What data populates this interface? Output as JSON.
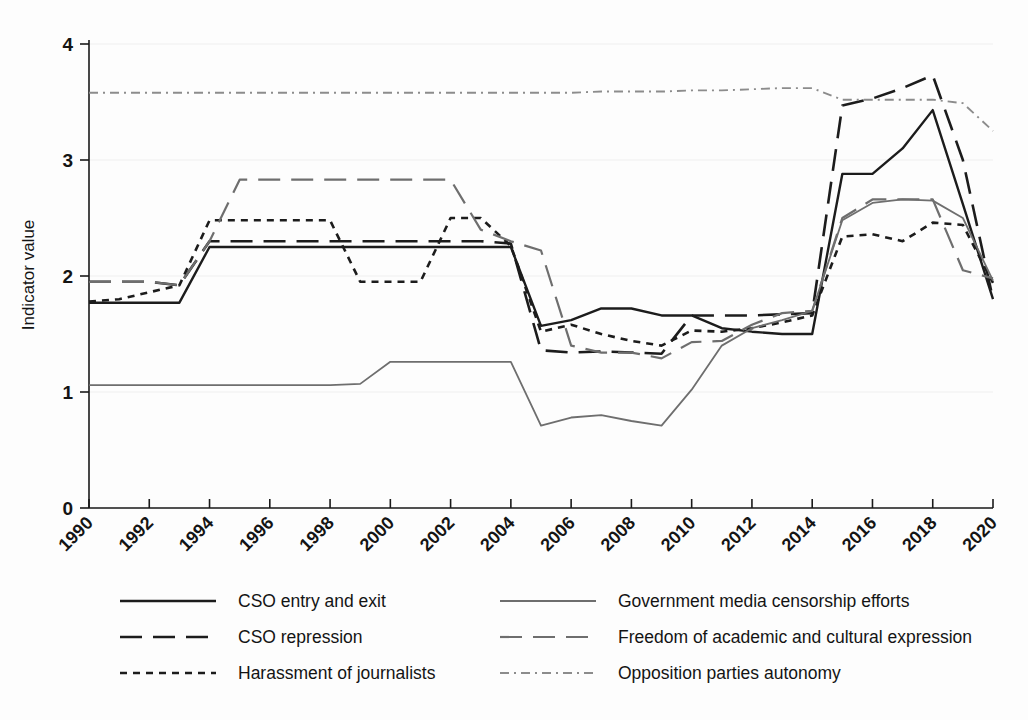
{
  "chart_data": {
    "type": "line",
    "title": "",
    "subtitle": "",
    "xlabel": "",
    "ylabel": "Indicator value",
    "xlim": [
      1990,
      2020
    ],
    "ylim": [
      0,
      4
    ],
    "yticks": [
      "0",
      "1",
      "2",
      "3",
      "4"
    ],
    "xticks": [
      "1990",
      "1992",
      "1994",
      "1996",
      "1998",
      "2000",
      "2002",
      "2004",
      "2006",
      "2008",
      "2010",
      "2012",
      "2014",
      "2016",
      "2018",
      "2020"
    ],
    "grid": "horizontal-faint",
    "legend_position": "below-axes",
    "x": [
      1990,
      1991,
      1992,
      1993,
      1994,
      1995,
      1996,
      1997,
      1998,
      1999,
      2000,
      2001,
      2002,
      2003,
      2004,
      2005,
      2006,
      2007,
      2008,
      2009,
      2010,
      2011,
      2012,
      2013,
      2014,
      2015,
      2016,
      2017,
      2018,
      2019,
      2020
    ],
    "series": [
      {
        "name": "CSO entry and exit",
        "style": "solid",
        "color": "#1c1c1c",
        "width": 2.4,
        "values": [
          1.77,
          1.77,
          1.77,
          1.77,
          2.25,
          2.25,
          2.25,
          2.25,
          2.25,
          2.25,
          2.25,
          2.25,
          2.25,
          2.25,
          2.25,
          1.57,
          1.62,
          1.72,
          1.72,
          1.66,
          1.66,
          1.55,
          1.52,
          1.5,
          1.5,
          2.88,
          2.88,
          3.1,
          3.43,
          2.62,
          1.8
        ]
      },
      {
        "name": "CSO repression",
        "style": "long-dash",
        "color": "#1c1c1c",
        "width": 2.6,
        "values": [
          1.95,
          1.95,
          1.95,
          1.92,
          2.3,
          2.3,
          2.3,
          2.3,
          2.3,
          2.3,
          2.3,
          2.3,
          2.3,
          2.3,
          2.28,
          1.36,
          1.34,
          1.35,
          1.34,
          1.33,
          1.66,
          1.66,
          1.66,
          1.67,
          1.68,
          3.47,
          3.53,
          3.62,
          3.73,
          3.0,
          1.8
        ]
      },
      {
        "name": "Harassment of journalists",
        "style": "short-dash",
        "color": "#1c1c1c",
        "width": 2.6,
        "values": [
          1.78,
          1.8,
          1.86,
          1.92,
          2.48,
          2.48,
          2.48,
          2.48,
          2.48,
          1.95,
          1.95,
          1.95,
          2.5,
          2.5,
          2.26,
          1.52,
          1.58,
          1.5,
          1.44,
          1.4,
          1.53,
          1.52,
          1.55,
          1.6,
          1.66,
          2.34,
          2.36,
          2.3,
          2.46,
          2.44,
          1.94
        ]
      },
      {
        "name": "Government media censorship efforts",
        "style": "solid",
        "color": "#6e6e6e",
        "width": 1.8,
        "values": [
          1.06,
          1.06,
          1.06,
          1.06,
          1.06,
          1.06,
          1.06,
          1.06,
          1.06,
          1.07,
          1.26,
          1.26,
          1.26,
          1.26,
          1.26,
          0.71,
          0.78,
          0.8,
          0.75,
          0.71,
          1.02,
          1.4,
          1.55,
          1.62,
          1.7,
          2.48,
          2.63,
          2.66,
          2.65,
          2.5,
          1.96
        ]
      },
      {
        "name": "Freedom of academic and cultural expression",
        "style": "long-dash",
        "color": "#6e6e6e",
        "width": 2.2,
        "values": [
          1.95,
          1.95,
          1.95,
          1.92,
          2.3,
          2.83,
          2.83,
          2.83,
          2.83,
          2.83,
          2.83,
          2.83,
          2.83,
          2.4,
          2.3,
          2.22,
          1.4,
          1.34,
          1.34,
          1.29,
          1.43,
          1.44,
          1.58,
          1.68,
          1.7,
          2.5,
          2.66,
          2.66,
          2.66,
          2.05,
          1.98
        ]
      },
      {
        "name": "Opposition parties autonomy",
        "style": "dash-dot",
        "color": "#8c8c8c",
        "width": 1.9,
        "values": [
          3.58,
          3.58,
          3.58,
          3.58,
          3.58,
          3.58,
          3.58,
          3.58,
          3.58,
          3.58,
          3.58,
          3.58,
          3.58,
          3.58,
          3.58,
          3.58,
          3.58,
          3.59,
          3.59,
          3.59,
          3.6,
          3.6,
          3.61,
          3.62,
          3.62,
          3.52,
          3.52,
          3.52,
          3.52,
          3.49,
          3.25
        ]
      }
    ]
  },
  "legend": {
    "entries": [
      {
        "label": "CSO entry and exit",
        "style": "solid",
        "color": "#1c1c1c",
        "column": 0,
        "row": 0
      },
      {
        "label": "CSO repression",
        "style": "long-dash",
        "color": "#1c1c1c",
        "column": 0,
        "row": 1
      },
      {
        "label": "Harassment of journalists",
        "style": "short-dash",
        "color": "#1c1c1c",
        "column": 0,
        "row": 2
      },
      {
        "label": "Government media censorship efforts",
        "style": "solid",
        "color": "#6e6e6e",
        "column": 1,
        "row": 0
      },
      {
        "label": "Freedom of academic and cultural expression",
        "style": "long-dash",
        "color": "#6e6e6e",
        "column": 1,
        "row": 1
      },
      {
        "label": "Opposition parties autonomy",
        "style": "dash-dot",
        "color": "#8c8c8c",
        "column": 1,
        "row": 2
      }
    ]
  },
  "axes": {
    "y_title": "Indicator value"
  }
}
